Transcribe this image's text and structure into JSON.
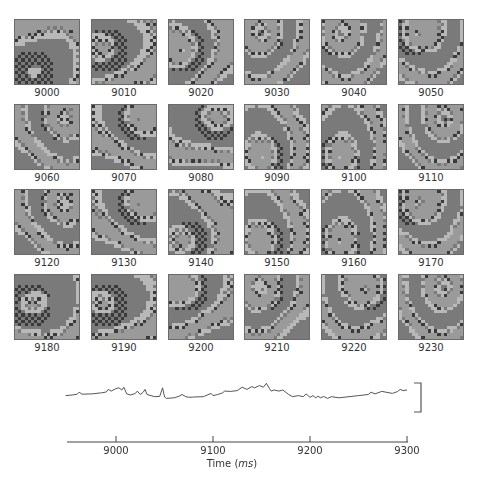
{
  "figure": {
    "frames": [
      {
        "label": "9000",
        "seed": 11,
        "front": "bottom-left"
      },
      {
        "label": "9010",
        "seed": 12,
        "front": "left"
      },
      {
        "label": "9020",
        "seed": 13,
        "front": "left"
      },
      {
        "label": "9030",
        "seed": 14,
        "front": "top-left"
      },
      {
        "label": "9040",
        "seed": 15,
        "front": "top-left"
      },
      {
        "label": "9050",
        "seed": 16,
        "front": "top-left"
      },
      {
        "label": "9060",
        "seed": 17,
        "front": "top-right"
      },
      {
        "label": "9070",
        "seed": 18,
        "front": "top-right"
      },
      {
        "label": "9080",
        "seed": 19,
        "front": "top-right"
      },
      {
        "label": "9090",
        "seed": 20,
        "front": "bottom-left"
      },
      {
        "label": "9100",
        "seed": 21,
        "front": "bottom-left"
      },
      {
        "label": "9110",
        "seed": 22,
        "front": "top-right"
      },
      {
        "label": "9120",
        "seed": 23,
        "front": "top-right"
      },
      {
        "label": "9130",
        "seed": 24,
        "front": "top-right"
      },
      {
        "label": "9140",
        "seed": 25,
        "front": "bottom-left"
      },
      {
        "label": "9150",
        "seed": 26,
        "front": "bottom-left"
      },
      {
        "label": "9160",
        "seed": 27,
        "front": "bottom-left"
      },
      {
        "label": "9170",
        "seed": 28,
        "front": "top-left"
      },
      {
        "label": "9180",
        "seed": 29,
        "front": "left"
      },
      {
        "label": "9190",
        "seed": 30,
        "front": "left"
      },
      {
        "label": "9200",
        "seed": 31,
        "front": "top-left"
      },
      {
        "label": "9210",
        "seed": 32,
        "front": "top-left"
      },
      {
        "label": "9220",
        "seed": 33,
        "front": "top-right"
      },
      {
        "label": "9230",
        "seed": 34,
        "front": "top-right"
      }
    ],
    "grid": {
      "columns": 6,
      "rows": 4,
      "origin_x": 14,
      "origin_y": 19,
      "step_x": 76.8,
      "step_y": 85,
      "tile_size": 66,
      "cells": 20
    },
    "colors": {
      "light": "#b8b8b8",
      "mid": "#9a9a9a",
      "darkmid": "#7a7a7a",
      "dark": "#3a3a3a",
      "border": "#6a6a6a",
      "trace": "#555555"
    },
    "trace": {
      "description": "Optical signal trace",
      "scale_bar": "vertical bracket (no label)"
    },
    "axis": {
      "title_prefix": "Time (",
      "title_unit": "ms",
      "title_suffix": ")",
      "ticks": [
        "9000",
        "9100",
        "9200",
        "9300"
      ]
    }
  },
  "chart_data": {
    "type": "line",
    "title": "",
    "xlabel": "Time (ms)",
    "ylabel": "",
    "xlim": [
      8948,
      9300
    ],
    "x_ticks": [
      9000,
      9100,
      9200,
      9300
    ],
    "grid": false,
    "series": [
      {
        "name": "signal",
        "x": [
          8948,
          8955,
          8960,
          8962,
          8965,
          8975,
          8985,
          8990,
          8992,
          8995,
          9000,
          9003,
          9006,
          9008,
          9011,
          9015,
          9020,
          9022,
          9025,
          9028,
          9030,
          9032,
          9040,
          9045,
          9048,
          9050,
          9052,
          9060,
          9065,
          9068,
          9072,
          9075,
          9080,
          9090,
          9098,
          9100,
          9105,
          9110,
          9112,
          9118,
          9125,
          9130,
          9135,
          9140,
          9143,
          9148,
          9152,
          9155,
          9158,
          9160,
          9163,
          9168,
          9172,
          9178,
          9182,
          9188,
          9193,
          9196,
          9200,
          9203,
          9206,
          9208,
          9211,
          9214,
          9218,
          9222,
          9230,
          9250,
          9260,
          9263,
          9267,
          9270,
          9274,
          9285,
          9290,
          9293,
          9296,
          9300
        ],
        "values": [
          0.3,
          0.32,
          0.35,
          0.42,
          0.35,
          0.36,
          0.4,
          0.43,
          0.52,
          0.46,
          0.55,
          0.58,
          0.5,
          0.6,
          0.36,
          0.32,
          0.38,
          0.46,
          0.34,
          0.42,
          0.52,
          0.34,
          0.26,
          0.27,
          0.58,
          0.25,
          0.2,
          0.22,
          0.28,
          0.34,
          0.26,
          0.24,
          0.25,
          0.26,
          0.38,
          0.3,
          0.34,
          0.4,
          0.46,
          0.45,
          0.48,
          0.6,
          0.52,
          0.62,
          0.58,
          0.66,
          0.6,
          0.74,
          0.56,
          0.46,
          0.5,
          0.46,
          0.5,
          0.34,
          0.26,
          0.3,
          0.26,
          0.36,
          0.24,
          0.3,
          0.22,
          0.28,
          0.22,
          0.27,
          0.2,
          0.26,
          0.22,
          0.3,
          0.34,
          0.42,
          0.36,
          0.4,
          0.45,
          0.38,
          0.44,
          0.52,
          0.48,
          0.5
        ]
      }
    ]
  }
}
